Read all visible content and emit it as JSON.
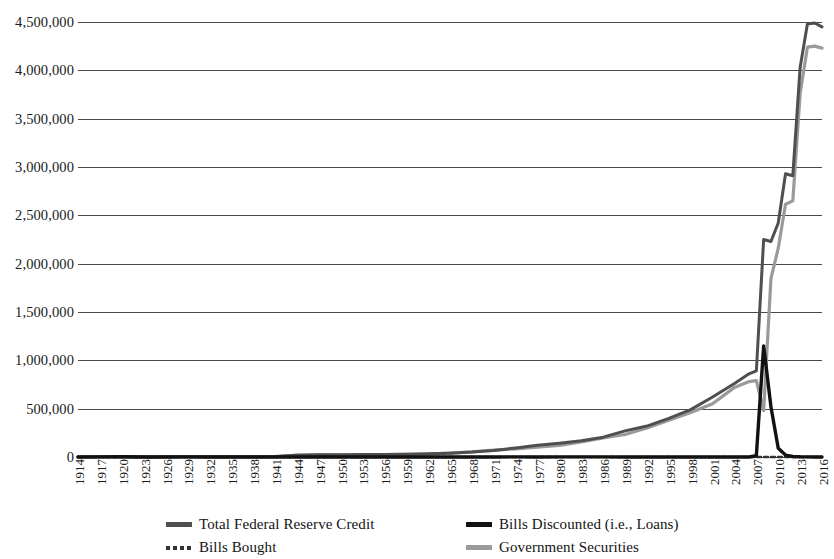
{
  "chart_data": {
    "type": "line",
    "title": "",
    "xlabel": "",
    "ylabel": "",
    "xlim": [
      1914,
      2016
    ],
    "ylim": [
      0,
      4500000
    ],
    "grid": true,
    "legend_position": "bottom",
    "y_ticks": [
      "0",
      "500,000",
      "1,000,000",
      "1,500,000",
      "2,000,000",
      "2,500,000",
      "3,000,000",
      "3,500,000",
      "4,000,000",
      "4,500,000"
    ],
    "y_tick_values": [
      0,
      500000,
      1000000,
      1500000,
      2000000,
      2500000,
      3000000,
      3500000,
      4000000,
      4500000
    ],
    "x_ticks": [
      "1914",
      "1917",
      "1920",
      "1923",
      "1926",
      "1929",
      "1932",
      "1935",
      "1938",
      "1941",
      "1944",
      "1947",
      "1950",
      "1953",
      "1956",
      "1959",
      "1962",
      "1965",
      "1968",
      "1971",
      "1974",
      "1977",
      "1980",
      "1983",
      "1986",
      "1989",
      "1992",
      "1995",
      "1998",
      "2001",
      "2004",
      "2007",
      "2010",
      "2013",
      "2016"
    ],
    "series": [
      {
        "name": "Total Federal Reserve Credit",
        "color": "#4f4f4f",
        "style": "solid",
        "width": 3.0,
        "x": [
          1914,
          1917,
          1920,
          1923,
          1926,
          1929,
          1932,
          1935,
          1938,
          1941,
          1944,
          1947,
          1950,
          1953,
          1956,
          1959,
          1962,
          1965,
          1968,
          1971,
          1974,
          1977,
          1980,
          1983,
          1986,
          1989,
          1992,
          1995,
          1998,
          2001,
          2004,
          2006,
          2007,
          2008,
          2009,
          2010,
          2011,
          2012,
          2013,
          2014,
          2015,
          2016
        ],
        "values": [
          0,
          1500,
          3300,
          1200,
          1400,
          1600,
          2100,
          2500,
          2600,
          4000,
          19000,
          23000,
          23000,
          27000,
          26000,
          29000,
          33000,
          40000,
          51000,
          68000,
          93000,
          121000,
          143000,
          168000,
          205000,
          270000,
          320000,
          400000,
          490000,
          620000,
          760000,
          860000,
          890000,
          2250000,
          2230000,
          2420000,
          2930000,
          2910000,
          4030000,
          4480000,
          4490000,
          4450000
        ]
      },
      {
        "name": "Bills Discounted (i.e., Loans)",
        "color": "#121212",
        "style": "solid",
        "width": 3.4,
        "x": [
          1914,
          1917,
          1920,
          1923,
          1926,
          1929,
          1932,
          1935,
          1938,
          1941,
          1944,
          1947,
          1950,
          1953,
          1956,
          1959,
          1962,
          1965,
          1968,
          1971,
          1974,
          1977,
          1980,
          1983,
          1986,
          1989,
          1992,
          1995,
          1998,
          2001,
          2004,
          2006,
          2007,
          2008,
          2009,
          2010,
          2011,
          2012,
          2013,
          2014,
          2015,
          2016
        ],
        "values": [
          0,
          900,
          2500,
          600,
          650,
          800,
          250,
          10,
          5,
          5,
          250,
          150,
          100,
          150,
          100,
          500,
          100,
          150,
          500,
          100,
          1300,
          300,
          1600,
          900,
          1500,
          300,
          200,
          100,
          100,
          100,
          50,
          50,
          15000,
          1150000,
          520000,
          90000,
          20000,
          5000,
          2000,
          1000,
          500,
          300
        ]
      },
      {
        "name": "Bills Bought",
        "color": "#333333",
        "style": "dotted",
        "width": 2.4,
        "x": [
          1914,
          1917,
          1920,
          1923,
          1926,
          1929,
          1932,
          1935,
          1938,
          1941,
          1944,
          1947,
          1950,
          1953,
          1956,
          1959,
          1962,
          1965,
          1968,
          1971,
          1974,
          1977,
          1980,
          1983,
          1986,
          1989,
          1992,
          1995,
          1998,
          2001,
          2004,
          2007,
          2010,
          2013,
          2016
        ],
        "values": [
          0,
          250,
          400,
          200,
          250,
          300,
          50,
          5,
          1,
          1,
          50,
          20,
          10,
          10,
          10,
          10,
          5,
          5,
          5,
          5,
          5,
          5,
          5,
          5,
          5,
          0,
          0,
          0,
          0,
          0,
          0,
          0,
          0,
          0,
          0
        ]
      },
      {
        "name": "Government Securities",
        "color": "#9a9a9a",
        "style": "solid",
        "width": 3.2,
        "x": [
          1914,
          1917,
          1920,
          1923,
          1926,
          1929,
          1932,
          1935,
          1938,
          1941,
          1944,
          1947,
          1950,
          1953,
          1956,
          1959,
          1962,
          1965,
          1968,
          1971,
          1974,
          1977,
          1980,
          1983,
          1986,
          1989,
          1992,
          1995,
          1998,
          2001,
          2004,
          2006,
          2007,
          2008,
          2009,
          2010,
          2011,
          2012,
          2013,
          2014,
          2015,
          2016
        ],
        "values": [
          0,
          100,
          300,
          100,
          350,
          500,
          1800,
          2430,
          2560,
          2250,
          18500,
          22600,
          20300,
          25900,
          24900,
          26600,
          30500,
          40800,
          52500,
          70800,
          85000,
          102000,
          121000,
          155000,
          197000,
          233000,
          300000,
          380000,
          460000,
          550000,
          720000,
          780000,
          790000,
          480000,
          1845000,
          2160000,
          2615000,
          2650000,
          3760000,
          4240000,
          4250000,
          4230000
        ]
      }
    ]
  },
  "legend": {
    "items": [
      {
        "label": "Total Federal Reserve Credit",
        "swatch": "line-solid-darkgray-icon",
        "color": "#4f4f4f",
        "style": "solid"
      },
      {
        "label": "Bills Discounted (i.e., Loans)",
        "swatch": "line-solid-black-icon",
        "color": "#121212",
        "style": "solid"
      },
      {
        "label": "Bills Bought",
        "swatch": "line-dotted-icon",
        "color": "#333333",
        "style": "dotted"
      },
      {
        "label": "Government Securities",
        "swatch": "line-solid-lightgray-icon",
        "color": "#9a9a9a",
        "style": "solid"
      }
    ]
  }
}
